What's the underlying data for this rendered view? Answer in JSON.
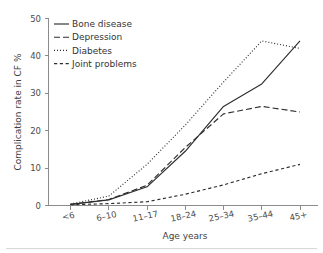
{
  "chart_data": {
    "type": "line",
    "title": "",
    "xlabel": "Age years",
    "ylabel": "Complication rate in CF %",
    "categories": [
      "<6",
      "6–10",
      "11–17",
      "18–24",
      "25–34",
      "35–44",
      "45+"
    ],
    "ylim": [
      0,
      50
    ],
    "yticks": [
      0,
      10,
      20,
      30,
      40,
      50
    ],
    "ytick_labels": [
      "0",
      "10",
      "20",
      "30",
      "40",
      "50"
    ],
    "grid": false,
    "legend_position": "top-left",
    "series": [
      {
        "name": "Bone disease",
        "style": "solid",
        "values": [
          0.3,
          1.5,
          5.0,
          14.5,
          26.5,
          32.5,
          44.0
        ]
      },
      {
        "name": "Depression",
        "style": "dashed",
        "values": [
          0.3,
          1.6,
          5.4,
          15.5,
          24.5,
          26.5,
          25.0
        ]
      },
      {
        "name": "Diabetes",
        "style": "dotted",
        "values": [
          0.4,
          2.5,
          11.0,
          21.5,
          33.0,
          44.0,
          42.0
        ]
      },
      {
        "name": "Joint problems",
        "style": "dashdot",
        "values": [
          0.2,
          0.5,
          1.0,
          3.0,
          5.5,
          8.5,
          11.0
        ]
      }
    ]
  },
  "axes": {
    "y_title": "Complication rate in CF %",
    "x_title": "Age years"
  },
  "colors": {
    "line": "#2e2e2e",
    "axis": "#8c8c8c",
    "text": "#3a3a3a",
    "background": "#ffffff",
    "footer_rule": "#d8d8d8"
  }
}
